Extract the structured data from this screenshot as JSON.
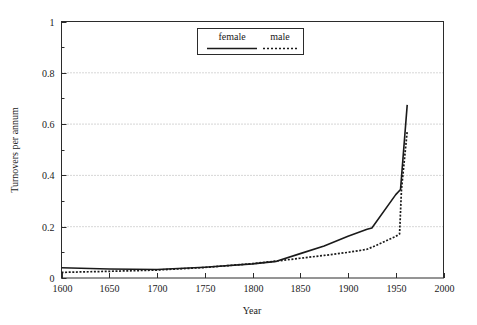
{
  "chart_data": {
    "type": "line",
    "title": "",
    "xlabel": "Year",
    "ylabel": "Turnovers per annum",
    "xlim": [
      1600,
      2000
    ],
    "ylim": [
      0,
      1
    ],
    "xticks": [
      1600,
      1650,
      1700,
      1750,
      1800,
      1850,
      1900,
      1950,
      2000
    ],
    "xtick_labels": [
      "1600",
      "1650",
      "1700",
      "1750",
      "1800",
      "1850",
      "1900",
      "1950",
      "2000"
    ],
    "yticks": [
      0,
      0.2,
      0.4,
      0.6,
      0.8,
      1
    ],
    "ytick_labels": [
      "0",
      "0.2",
      "0.4",
      "0.6",
      "0.8",
      "1"
    ],
    "y_minor_ticks": [
      0.1,
      0.3,
      0.5,
      0.7,
      0.9
    ],
    "grid": "horizontal-dotted-at-major-y",
    "legend_position": "top-center",
    "series": [
      {
        "name": "female",
        "style": "solid",
        "color": "#1a1a1a",
        "x": [
          1600,
          1650,
          1700,
          1750,
          1800,
          1825,
          1850,
          1875,
          1900,
          1920,
          1925,
          1950,
          1955,
          1962
        ],
        "y": [
          0.04,
          0.035,
          0.033,
          0.042,
          0.055,
          0.065,
          0.095,
          0.125,
          0.163,
          0.19,
          0.195,
          0.325,
          0.345,
          0.675
        ]
      },
      {
        "name": "male",
        "style": "dotted",
        "color": "#1a1a1a",
        "x": [
          1600,
          1650,
          1700,
          1750,
          1800,
          1825,
          1850,
          1875,
          1900,
          1920,
          1930,
          1950,
          1954,
          1956,
          1962
        ],
        "y": [
          0.022,
          0.026,
          0.031,
          0.041,
          0.056,
          0.066,
          0.077,
          0.088,
          0.1,
          0.112,
          0.128,
          0.162,
          0.172,
          0.345,
          0.572
        ]
      }
    ]
  },
  "legend": {
    "entries": [
      {
        "label": "female"
      },
      {
        "label": "male"
      }
    ]
  },
  "axes": {
    "x_title": "Year",
    "y_title": "Turnovers per annum"
  }
}
